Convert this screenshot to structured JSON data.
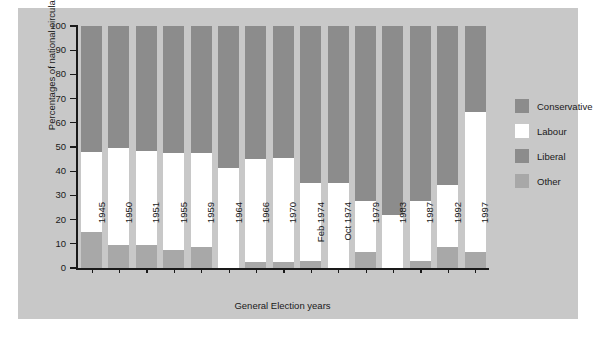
{
  "chart_data": {
    "type": "bar",
    "subtype": "stacked-bar-100",
    "title": "",
    "xlabel": "General Election years",
    "ylabel": "Percentages of national circulation",
    "ylim": [
      0,
      100
    ],
    "yticks": [
      0,
      10,
      20,
      30,
      40,
      50,
      60,
      70,
      80,
      90,
      100
    ],
    "ytick_labels": [
      "0",
      "10",
      "20",
      "30",
      "40",
      "50",
      "60",
      "70",
      "80",
      "90",
      "100"
    ],
    "grid": false,
    "legend_position": "right",
    "categories": [
      "1945",
      "1950",
      "1951",
      "1955",
      "1959",
      "1964",
      "1966",
      "1970",
      "Feb 1974",
      "Oct 1974",
      "1979",
      "1983",
      "1987",
      "1992",
      "1997"
    ],
    "series": [
      {
        "name": "Other",
        "color": "#a8a8a8",
        "values": [
          15.0,
          9.5,
          9.5,
          7.5,
          8.5,
          0.0,
          2.5,
          2.5,
          3.0,
          0.0,
          6.5,
          0.0,
          3.0,
          8.5,
          6.5
        ]
      },
      {
        "name": "Labour",
        "color": "#ffffff",
        "values": [
          33.0,
          40.0,
          39.0,
          40.0,
          39.0,
          41.5,
          42.5,
          43.0,
          32.0,
          35.0,
          21.0,
          22.0,
          24.5,
          26.0,
          58.0
        ]
      },
      {
        "name": "Liberal",
        "color": "#8c8c8c",
        "values": [
          0.0,
          0.0,
          0.0,
          0.0,
          0.0,
          0.0,
          0.0,
          0.0,
          0.0,
          0.0,
          0.0,
          0.0,
          0.0,
          0.0,
          0.0
        ]
      },
      {
        "name": "Conservative",
        "color": "#8c8c8c",
        "values": [
          52.0,
          50.5,
          51.5,
          52.5,
          52.5,
          58.5,
          55.0,
          54.5,
          65.0,
          65.0,
          72.5,
          78.0,
          72.5,
          65.5,
          35.5
        ]
      }
    ],
    "stack_order_bottom_to_top": [
      "Other",
      "Labour",
      "Liberal",
      "Conservative"
    ]
  },
  "legend": {
    "items": [
      {
        "label": "Conservative",
        "color": "#8c8c8c"
      },
      {
        "label": "Labour",
        "color": "#ffffff"
      },
      {
        "label": "Liberal",
        "color": "#8c8c8c"
      },
      {
        "label": "Other",
        "color": "#a8a8a8"
      }
    ]
  },
  "colors": {
    "panel_background": "#c8c8c8",
    "figure_background": "#ffffff",
    "axis": "#1a1a1a",
    "conservative": "#8c8c8c",
    "labour": "#ffffff",
    "liberal": "#8c8c8c",
    "other": "#a8a8a8"
  }
}
